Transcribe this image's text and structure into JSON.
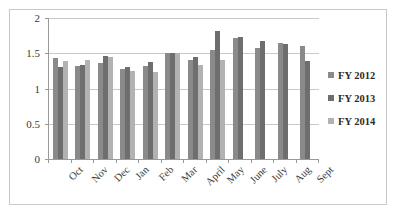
{
  "chart_data": {
    "type": "bar",
    "title": "",
    "subtitle": "",
    "xlabel": "",
    "ylabel": "",
    "ylim": [
      0,
      2
    ],
    "yticks": [
      0,
      0.5,
      1,
      1.5,
      2
    ],
    "ytick_labels": [
      "0",
      "0.5",
      "1",
      "1.5",
      "2"
    ],
    "grid": true,
    "legend_position": "right",
    "categories": [
      "Oct",
      "Nov",
      "Dec",
      "Jan",
      "Feb",
      "Mar",
      "April",
      "May",
      "June",
      "July",
      "Aug",
      "Sept"
    ],
    "series": [
      {
        "name": "FY 2012",
        "color": "#8a8a8a",
        "values": [
          1.43,
          1.32,
          1.36,
          1.28,
          1.32,
          1.5,
          1.4,
          1.54,
          1.72,
          1.58,
          1.64,
          1.61
        ]
      },
      {
        "name": "FY 2013",
        "color": "#6e6e6e",
        "values": [
          1.31,
          1.33,
          1.46,
          1.3,
          1.37,
          1.5,
          1.44,
          1.81,
          1.73,
          1.68,
          1.63,
          1.39
        ]
      },
      {
        "name": "FY 2014",
        "color": "#b2b2b2",
        "values": [
          1.39,
          1.41,
          1.44,
          1.25,
          1.24,
          1.5,
          1.34,
          1.4,
          null,
          null,
          null,
          null
        ]
      }
    ]
  },
  "legend": {
    "items": [
      {
        "label": "FY 2012",
        "color": "#8a8a8a"
      },
      {
        "label": "FY 2013",
        "color": "#6e6e6e"
      },
      {
        "label": "FY 2014",
        "color": "#b2b2b2"
      }
    ]
  },
  "axes": {
    "y_tick_labels": [
      "2",
      "1.5",
      "1",
      "0.5",
      "0"
    ],
    "x_tick_labels": [
      "Oct",
      "Nov",
      "Dec",
      "Jan",
      "Feb",
      "Mar",
      "April",
      "May",
      "June",
      "July",
      "Aug",
      "Sept"
    ]
  }
}
